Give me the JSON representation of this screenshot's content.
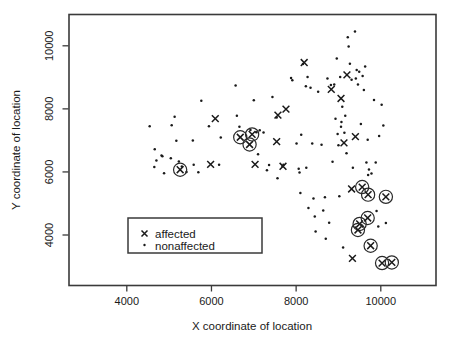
{
  "chart_data": {
    "type": "scatter",
    "title": "",
    "xlabel": "X coordinate of location",
    "ylabel": "Y coordinate of location",
    "xlim": [
      2900,
      10900
    ],
    "ylim": [
      2600,
      10900
    ],
    "xticks": [
      4000,
      6000,
      8000,
      10000
    ],
    "yticks": [
      4000,
      6000,
      8000,
      10000
    ],
    "xticklabels": [
      "4000",
      "6000",
      "8000",
      "10000"
    ],
    "yticklabels": [
      "4000",
      "6000",
      "8000",
      "10000"
    ],
    "grid": false,
    "legend_position": "lower-left-inside",
    "series": [
      {
        "name": "nonaffected",
        "marker": "dot",
        "points": [
          [
            4540,
            7450
          ],
          [
            4660,
            6720
          ],
          [
            4650,
            6160
          ],
          [
            4700,
            6360
          ],
          [
            4820,
            6520
          ],
          [
            4840,
            6500
          ],
          [
            4880,
            5960
          ],
          [
            5060,
            7480
          ],
          [
            5040,
            6430
          ],
          [
            5130,
            7750
          ],
          [
            5170,
            6990
          ],
          [
            5230,
            6330
          ],
          [
            5300,
            6170
          ],
          [
            5410,
            6000
          ],
          [
            5560,
            7000
          ],
          [
            5580,
            6230
          ],
          [
            5690,
            5990
          ],
          [
            5760,
            8260
          ],
          [
            5940,
            7450
          ],
          [
            6220,
            7090
          ],
          [
            6180,
            6230
          ],
          [
            6570,
            8740
          ],
          [
            6600,
            7780
          ],
          [
            6660,
            7430
          ],
          [
            6920,
            7330
          ],
          [
            7000,
            8270
          ],
          [
            7060,
            7260
          ],
          [
            7140,
            7320
          ],
          [
            7230,
            7250
          ],
          [
            7100,
            6560
          ],
          [
            7310,
            6050
          ],
          [
            7360,
            6220
          ],
          [
            7440,
            8380
          ],
          [
            7540,
            7730
          ],
          [
            7680,
            6180
          ],
          [
            7700,
            6230
          ],
          [
            7560,
            5800
          ],
          [
            7880,
            8980
          ],
          [
            7910,
            8910
          ],
          [
            8010,
            6900
          ],
          [
            8060,
            6100
          ],
          [
            8080,
            5980
          ],
          [
            8100,
            5330
          ],
          [
            8160,
            9420
          ],
          [
            8230,
            8720
          ],
          [
            8270,
            9010
          ],
          [
            8290,
            4860
          ],
          [
            8340,
            8670
          ],
          [
            8380,
            6900
          ],
          [
            8410,
            5160
          ],
          [
            8440,
            4590
          ],
          [
            8460,
            4110
          ],
          [
            8520,
            8540
          ],
          [
            8600,
            6860
          ],
          [
            8640,
            4780
          ],
          [
            8680,
            5200
          ],
          [
            8700,
            3880
          ],
          [
            8740,
            8960
          ],
          [
            8780,
            4390
          ],
          [
            8820,
            8760
          ],
          [
            8900,
            8770
          ],
          [
            8930,
            7690
          ],
          [
            8960,
            9600
          ],
          [
            8980,
            7200
          ],
          [
            9000,
            6850
          ],
          [
            9020,
            5230
          ],
          [
            9040,
            9010
          ],
          [
            9060,
            7430
          ],
          [
            9070,
            7580
          ],
          [
            9090,
            8070
          ],
          [
            9110,
            3600
          ],
          [
            9140,
            7240
          ],
          [
            9160,
            7780
          ],
          [
            9190,
            6590
          ],
          [
            9220,
            10270
          ],
          [
            9240,
            9980
          ],
          [
            9270,
            9430
          ],
          [
            9310,
            8920
          ],
          [
            9340,
            6130
          ],
          [
            9390,
            10450
          ],
          [
            9410,
            8960
          ],
          [
            9430,
            9230
          ],
          [
            9460,
            8770
          ],
          [
            9490,
            9180
          ],
          [
            9530,
            7520
          ],
          [
            9570,
            9040
          ],
          [
            9600,
            8600
          ],
          [
            9630,
            9340
          ],
          [
            9660,
            6300
          ],
          [
            9690,
            7020
          ],
          [
            9720,
            6080
          ],
          [
            9780,
            5950
          ],
          [
            9840,
            8280
          ],
          [
            9880,
            6300
          ],
          [
            9900,
            4760
          ],
          [
            9940,
            4270
          ],
          [
            9960,
            7140
          ],
          [
            10020,
            8130
          ],
          [
            10060,
            7470
          ],
          [
            10120,
            4380
          ],
          [
            9700,
            5900
          ],
          [
            8860,
            6320
          ],
          [
            8240,
            6130
          ],
          [
            8120,
            7180
          ]
        ]
      },
      {
        "name": "affected",
        "marker": "x",
        "points": [
          [
            6090,
            7690
          ],
          [
            5980,
            6240
          ],
          [
            7030,
            6240
          ],
          [
            7570,
            7800
          ],
          [
            7760,
            7990
          ],
          [
            7690,
            6180
          ],
          [
            7540,
            6960
          ],
          [
            8190,
            9470
          ],
          [
            8830,
            8620
          ],
          [
            9060,
            8330
          ],
          [
            9130,
            6920
          ],
          [
            9200,
            9080
          ],
          [
            9310,
            5460
          ],
          [
            9400,
            7120
          ],
          [
            9330,
            3260
          ]
        ]
      },
      {
        "name": "affected-circled",
        "marker": "x-circle",
        "points": [
          [
            5260,
            6070
          ],
          [
            6680,
            7100
          ],
          [
            6960,
            7190
          ],
          [
            6900,
            6870
          ],
          [
            9560,
            5520
          ],
          [
            9700,
            5280
          ],
          [
            10120,
            5210
          ],
          [
            9500,
            4350
          ],
          [
            9460,
            4160
          ],
          [
            9690,
            4540
          ],
          [
            9760,
            3660
          ],
          [
            10030,
            3110
          ],
          [
            10260,
            3130
          ]
        ]
      }
    ]
  },
  "legend": {
    "entries": [
      {
        "marker": "x",
        "label": "affected"
      },
      {
        "marker": "dot",
        "label": "nonaffected"
      }
    ]
  },
  "colors": {
    "foreground": "#1a1a1a",
    "frame": "#3a3a3a",
    "background": "#ffffff"
  }
}
